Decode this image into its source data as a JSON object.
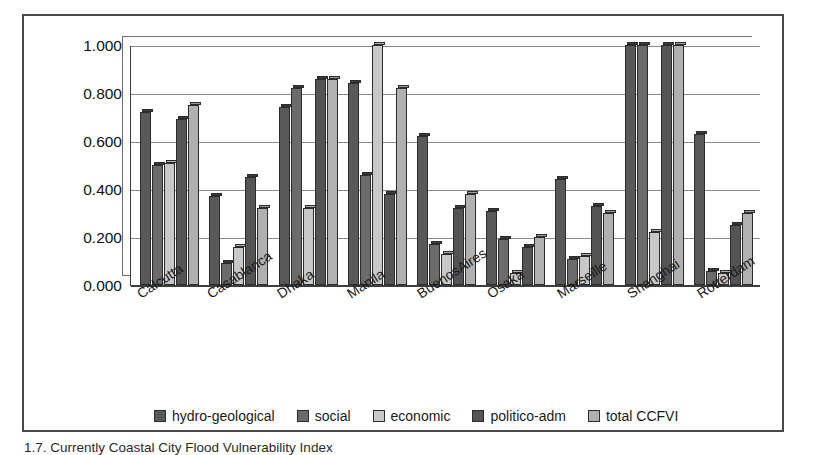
{
  "figure": {
    "caption": "1.7. Currently Coastal City Flood Vulnerability Index"
  },
  "axis": {
    "yticks": [
      "1.000",
      "0.800",
      "0.600",
      "0.400",
      "0.200",
      "0.000"
    ],
    "ymin": 0,
    "ymax": 1.0
  },
  "legend": {
    "items": [
      {
        "label": "hydro-geological",
        "color": "#595959",
        "swatch": "legend-swatch-hydro-geological"
      },
      {
        "label": "social",
        "color": "#6b6b6b",
        "swatch": "legend-swatch-social"
      },
      {
        "label": "economic",
        "color": "#c8c8c8",
        "swatch": "legend-swatch-economic"
      },
      {
        "label": "politico-adm",
        "color": "#545454",
        "swatch": "legend-swatch-politico-adm"
      },
      {
        "label": "total CCFVI",
        "color": "#b0b0b0",
        "swatch": "legend-swatch-total-ccfvi"
      }
    ]
  },
  "chart_data": {
    "type": "bar",
    "title": "",
    "xlabel": "",
    "ylabel": "",
    "ylim": [
      0,
      1.0
    ],
    "ytick_step": 0.2,
    "grid": true,
    "legend_position": "bottom",
    "categories": [
      "Calcutta",
      "Casablanca",
      "Dhaka",
      "Manila",
      "BuenosAires",
      "Osaka",
      "Marseille",
      "Shanghai",
      "Rotterdam"
    ],
    "series": [
      {
        "name": "hydro-geological",
        "color": "#595959",
        "values": [
          0.72,
          0.37,
          0.74,
          0.84,
          0.62,
          0.31,
          0.44,
          1.0,
          0.63
        ]
      },
      {
        "name": "social",
        "color": "#6b6b6b",
        "values": [
          0.5,
          0.09,
          0.82,
          0.46,
          0.17,
          0.19,
          0.11,
          1.0,
          0.06
        ]
      },
      {
        "name": "economic",
        "color": "#c8c8c8",
        "values": [
          0.51,
          0.16,
          0.32,
          1.0,
          0.13,
          0.05,
          0.12,
          0.22,
          0.05
        ]
      },
      {
        "name": "politico-adm",
        "color": "#545454",
        "values": [
          0.69,
          0.45,
          0.86,
          0.38,
          0.32,
          0.16,
          0.33,
          1.0,
          0.25
        ]
      },
      {
        "name": "total CCFVI",
        "color": "#b0b0b0",
        "values": [
          0.75,
          0.32,
          0.86,
          0.82,
          0.38,
          0.2,
          0.3,
          1.0,
          0.3
        ]
      }
    ]
  }
}
